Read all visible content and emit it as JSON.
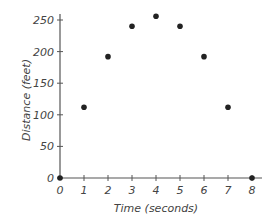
{
  "chart_data": {
    "type": "scatter",
    "title": "",
    "xlabel": "Time (seconds)",
    "ylabel": "Distance (feet)",
    "x": [
      0,
      1,
      2,
      3,
      4,
      5,
      6,
      7,
      8
    ],
    "y": [
      0,
      112,
      192,
      240,
      256,
      240,
      192,
      112,
      0
    ],
    "xlim": [
      0,
      8
    ],
    "ylim": [
      0,
      250
    ],
    "xticks": [
      0,
      1,
      2,
      3,
      4,
      5,
      6,
      7,
      8
    ],
    "yticks": [
      0,
      50,
      100,
      150,
      200,
      250
    ],
    "grid": false,
    "legend": null,
    "marker_color": "#222222",
    "axis_color": "#555555"
  }
}
